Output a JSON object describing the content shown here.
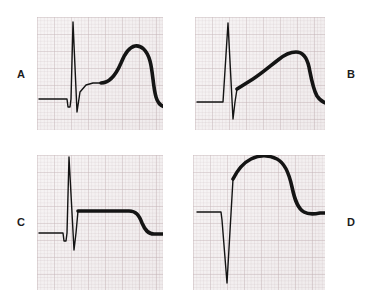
{
  "figure": {
    "title": "",
    "background_color": "#ffffff",
    "paper_color": "#f3eff0",
    "grid_color": "#96787d",
    "trace_color": "#141414",
    "layout": "2x2 grid of ECG graph-paper panels"
  },
  "panels": [
    {
      "id": "A",
      "label": "A",
      "label_position": "left",
      "x": 37,
      "y": 17,
      "width": 126,
      "height": 113,
      "description": "Baseline, small negative deflection, tall narrow spike, broad rounded dome returning to baseline",
      "trace_path": "M 2,82 L 30,82 L 31,90 L 33,90 L 34,82 L 36,5 L 40,95 L 43,75 L 49,68 L 56,66 L 64,66",
      "thick_path": "M 64,66 C 72,66 78,60 84,46 C 88,36 92,30 98,29 C 104,28 110,33 113,44 C 116,55 116,70 119,80 C 121,87 125,90 130,90 L 152,90"
    },
    {
      "id": "B",
      "label": "B",
      "label_position": "right",
      "x": 195,
      "y": 17,
      "width": 130,
      "height": 113,
      "description": "Baseline, narrow spike up then dipping below baseline, thick rising ramp to rounded peak, steep descent to baseline",
      "trace_path": "M 2,85 L 27,85 L 28,85 L 33,6 L 38,102 L 40,85 L 42,72",
      "thick_path": "M 42,72 L 58,62 C 66,57 74,50 83,43 C 89,38 95,35 101,35 C 108,35 112,41 114,50 C 116,60 118,72 122,79 C 126,85 131,87 137,87 L 158,87"
    },
    {
      "id": "C",
      "label": "C",
      "label_position": "left",
      "x": 37,
      "y": 155,
      "width": 126,
      "height": 135,
      "description": "Baseline, narrow tall spike with small negative dip, long flat elevated plateau, step-down to baseline at right",
      "trace_path": "M 2,78 L 26,78 L 27,86 L 29,86 L 30,78 L 32,2 L 37,95 L 39,78 L 41,56",
      "thick_path": "M 41,56 L 92,56 C 99,56 102,60 105,68 C 108,75 111,79 117,79 L 136,79"
    },
    {
      "id": "D",
      "label": "D",
      "label_position": "right",
      "x": 193,
      "y": 155,
      "width": 132,
      "height": 135,
      "description": "Baseline, very deep narrow downward spike, steep rise, thick tall rounded dome, descent back to baseline",
      "trace_path": "M 4,57 L 28,57 L 29,65 L 34,128 L 40,24",
      "thick_path": "M 40,24 C 44,16 50,8 58,4 C 66,0 76,0 84,4 C 92,8 96,18 99,32 C 102,46 105,54 111,57 C 116,60 122,59 127,58 L 134,58"
    }
  ],
  "labels": {
    "a": "A",
    "b": "B",
    "c": "C",
    "d": "D"
  }
}
